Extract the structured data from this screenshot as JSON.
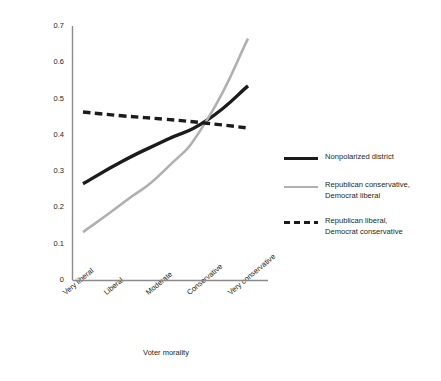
{
  "chart_data": {
    "type": "line",
    "title": "",
    "xlabel": "Voter morality",
    "ylabel": "Probability (vote Republican)",
    "categories": [
      "Very liberal",
      "Liberal",
      "Moderate",
      "Conservative",
      "Very conservative"
    ],
    "x": [
      1,
      2,
      3,
      4,
      5
    ],
    "ylim": [
      0,
      0.7
    ],
    "xlim": [
      0.75,
      5.25
    ],
    "yticks": [
      "0",
      "0.1",
      "0.2",
      "0.3",
      "0.4",
      "0.5",
      "0.6",
      "0.7"
    ],
    "ytick_values": [
      0,
      0.1,
      0.2,
      0.3,
      0.4,
      0.5,
      0.6,
      0.7
    ],
    "grid": false,
    "legend_position": "right",
    "series": [
      {
        "name": "Nonpolarized district",
        "style": "solid",
        "color": "#1b1b1b",
        "width": 3.4,
        "values": [
          0.265,
          0.33,
          0.385,
          0.44,
          0.535
        ]
      },
      {
        "name": "Republican conservative, Democrat liberal",
        "style": "solid",
        "color": "#b0b0b0",
        "width": 2.6,
        "values": [
          0.132,
          0.215,
          0.305,
          0.44,
          0.665
        ]
      },
      {
        "name": "Republican liberal, Democrat conservative",
        "style": "dashed",
        "color": "#1b1b1b",
        "width": 3.4,
        "values": [
          0.463,
          0.452,
          0.443,
          0.432,
          0.419
        ]
      }
    ]
  },
  "legend": {
    "entries": [
      {
        "label_line1": "Nonpolarized district",
        "label_line2": ""
      },
      {
        "label_line1": "Republican conservative,",
        "label_line2": "Democrat liberal"
      },
      {
        "label_line1": "Republican liberal,",
        "label_line2": "Democrat conservative"
      }
    ]
  }
}
